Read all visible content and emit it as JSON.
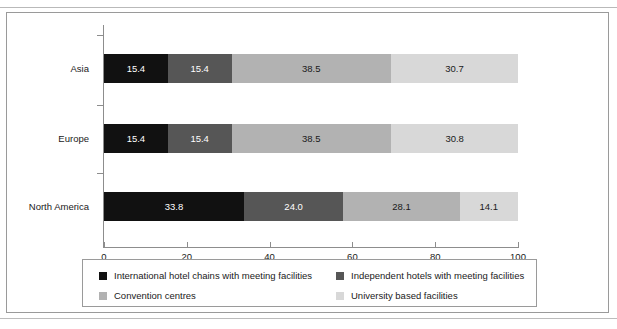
{
  "figure": {
    "frame_border_color": "#9a9a9a",
    "caption_partial": "",
    "source_partial": ""
  },
  "chart_data": {
    "type": "bar",
    "orientation": "horizontal",
    "stacked": true,
    "title": "",
    "xlabel": "",
    "ylabel": "",
    "xlim": [
      0,
      100
    ],
    "xticks": [
      "0",
      "20",
      "40",
      "60",
      "80",
      "100"
    ],
    "grid": false,
    "legend_position": "bottom",
    "categories": [
      "Asia",
      "Europe",
      "North America"
    ],
    "series": [
      {
        "name": "International hotel chains with meeting facilities",
        "color": "#111111",
        "label_color": "#ffffff",
        "values": [
          15.4,
          15.4,
          33.8
        ],
        "labels": [
          "15.4",
          "15.4",
          "33.8"
        ]
      },
      {
        "name": "Independent hotels with meeting facilities",
        "color": "#565656",
        "label_color": "#ffffff",
        "values": [
          15.4,
          15.4,
          24.0
        ],
        "labels": [
          "15.4",
          "15.4",
          "24.0"
        ]
      },
      {
        "name": "Convention centres",
        "color": "#b2b2b2",
        "label_color": "#1a1a1a",
        "values": [
          38.5,
          38.5,
          28.1
        ],
        "labels": [
          "38.5",
          "38.5",
          "28.1"
        ]
      },
      {
        "name": "University based facilities",
        "color": "#d8d8d8",
        "label_color": "#1a1a1a",
        "values": [
          30.7,
          30.8,
          14.1
        ],
        "labels": [
          "30.7",
          "30.8",
          "14.1"
        ]
      }
    ]
  }
}
